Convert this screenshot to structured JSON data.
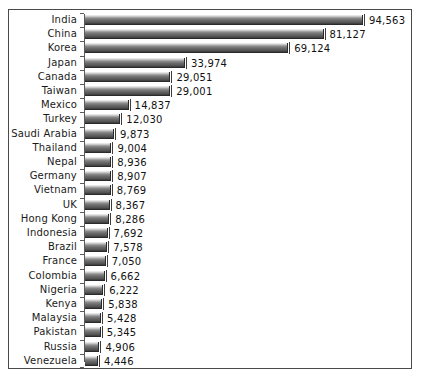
{
  "chart_data": {
    "type": "bar",
    "orientation": "horizontal",
    "title": "",
    "subtitle": "",
    "xlabel": "",
    "ylabel": "",
    "grid": false,
    "legend": null,
    "axis_ticks_visible": true,
    "value_labels_visible": true,
    "xlim": [
      0,
      94563
    ],
    "categories": [
      "India",
      "China",
      "Korea",
      "Japan",
      "Canada",
      "Taiwan",
      "Mexico",
      "Turkey",
      "Saudi Arabia",
      "Thailand",
      "Nepal",
      "Germany",
      "Vietnam",
      "UK",
      "Hong Kong",
      "Indonesia",
      "Brazil",
      "France",
      "Colombia",
      "Nigeria",
      "Kenya",
      "Malaysia",
      "Pakistan",
      "Russia",
      "Venezuela"
    ],
    "values": [
      94563,
      81127,
      69124,
      33974,
      29051,
      29001,
      14837,
      12030,
      9873,
      9004,
      8936,
      8907,
      8769,
      8367,
      8286,
      7692,
      7578,
      7050,
      6662,
      6222,
      5838,
      5428,
      5345,
      4906,
      4446
    ],
    "value_labels": [
      "94,563",
      "81,127",
      "69,124",
      "33,974",
      "29,051",
      "29,001",
      "14,837",
      "12,030",
      "9,873",
      "9,004",
      "8,936",
      "8,907",
      "8,769",
      "8,367",
      "8,286",
      "7,692",
      "7,578",
      "7,050",
      "6,662",
      "6,222",
      "5,838",
      "5,428",
      "5,345",
      "4,906",
      "4,446"
    ]
  },
  "style": {
    "frame_border_color": "#4a4a4a",
    "axis_color": "#5a5a5a",
    "bar_light": "#f2f2f2",
    "bar_dark": "#3a3a3a",
    "text_color": "#111111",
    "background": "#ffffff"
  }
}
